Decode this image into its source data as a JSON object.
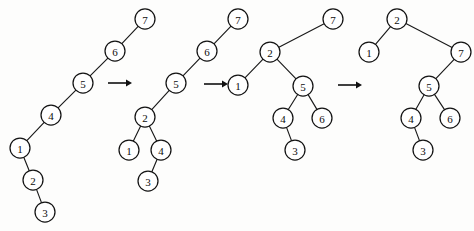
{
  "figure": {
    "background_color": "#fdfdfc",
    "node_fill_color": "#ffffff",
    "node_stroke_color": "#141414",
    "edge_color": "#1a1a1a",
    "arrow_color": "#111111",
    "node_radius": 10
  },
  "trees": [
    {
      "name": "tree-1",
      "root": "7",
      "nodes": [
        {
          "id": "t1-7",
          "label": "7",
          "x": 145,
          "y": 19
        },
        {
          "id": "t1-6",
          "label": "6",
          "x": 115,
          "y": 51
        },
        {
          "id": "t1-5",
          "label": "5",
          "x": 83,
          "y": 83
        },
        {
          "id": "t1-4",
          "label": "4",
          "x": 51,
          "y": 115
        },
        {
          "id": "t1-1",
          "label": "1",
          "x": 20,
          "y": 148
        },
        {
          "id": "t1-2",
          "label": "2",
          "x": 33,
          "y": 180
        },
        {
          "id": "t1-3",
          "label": "3",
          "x": 45,
          "y": 212
        }
      ],
      "edges": [
        {
          "from": "t1-7",
          "to": "t1-6"
        },
        {
          "from": "t1-6",
          "to": "t1-5"
        },
        {
          "from": "t1-5",
          "to": "t1-4"
        },
        {
          "from": "t1-4",
          "to": "t1-1"
        },
        {
          "from": "t1-1",
          "to": "t1-2"
        },
        {
          "from": "t1-2",
          "to": "t1-3"
        }
      ]
    },
    {
      "name": "tree-2",
      "root": "7",
      "nodes": [
        {
          "id": "t2-7",
          "label": "7",
          "x": 238,
          "y": 19
        },
        {
          "id": "t2-6",
          "label": "6",
          "x": 207,
          "y": 51
        },
        {
          "id": "t2-5",
          "label": "5",
          "x": 176,
          "y": 83
        },
        {
          "id": "t2-2",
          "label": "2",
          "x": 145,
          "y": 117
        },
        {
          "id": "t2-1",
          "label": "1",
          "x": 129,
          "y": 150
        },
        {
          "id": "t2-4",
          "label": "4",
          "x": 161,
          "y": 150
        },
        {
          "id": "t2-3",
          "label": "3",
          "x": 148,
          "y": 181
        }
      ],
      "edges": [
        {
          "from": "t2-7",
          "to": "t2-6"
        },
        {
          "from": "t2-6",
          "to": "t2-5"
        },
        {
          "from": "t2-5",
          "to": "t2-2"
        },
        {
          "from": "t2-2",
          "to": "t2-1"
        },
        {
          "from": "t2-2",
          "to": "t2-4"
        },
        {
          "from": "t2-4",
          "to": "t2-3"
        }
      ]
    },
    {
      "name": "tree-3",
      "root": "7",
      "nodes": [
        {
          "id": "t3-7",
          "label": "7",
          "x": 333,
          "y": 19
        },
        {
          "id": "t3-2",
          "label": "2",
          "x": 270,
          "y": 52
        },
        {
          "id": "t3-1",
          "label": "1",
          "x": 238,
          "y": 85
        },
        {
          "id": "t3-5",
          "label": "5",
          "x": 303,
          "y": 86
        },
        {
          "id": "t3-4",
          "label": "4",
          "x": 283,
          "y": 118
        },
        {
          "id": "t3-6",
          "label": "6",
          "x": 322,
          "y": 118
        },
        {
          "id": "t3-3",
          "label": "3",
          "x": 295,
          "y": 150
        }
      ],
      "edges": [
        {
          "from": "t3-7",
          "to": "t3-2"
        },
        {
          "from": "t3-2",
          "to": "t3-1"
        },
        {
          "from": "t3-2",
          "to": "t3-5"
        },
        {
          "from": "t3-5",
          "to": "t3-4"
        },
        {
          "from": "t3-5",
          "to": "t3-6"
        },
        {
          "from": "t3-4",
          "to": "t3-3"
        }
      ]
    },
    {
      "name": "tree-4",
      "root": "2",
      "nodes": [
        {
          "id": "t4-2",
          "label": "2",
          "x": 397,
          "y": 19
        },
        {
          "id": "t4-1",
          "label": "1",
          "x": 369,
          "y": 52
        },
        {
          "id": "t4-7",
          "label": "7",
          "x": 461,
          "y": 52
        },
        {
          "id": "t4-5",
          "label": "5",
          "x": 429,
          "y": 86
        },
        {
          "id": "t4-4",
          "label": "4",
          "x": 411,
          "y": 118
        },
        {
          "id": "t4-6",
          "label": "6",
          "x": 450,
          "y": 118
        },
        {
          "id": "t4-3",
          "label": "3",
          "x": 423,
          "y": 150
        }
      ],
      "edges": [
        {
          "from": "t4-2",
          "to": "t4-1"
        },
        {
          "from": "t4-2",
          "to": "t4-7"
        },
        {
          "from": "t4-7",
          "to": "t4-5"
        },
        {
          "from": "t4-5",
          "to": "t4-4"
        },
        {
          "from": "t4-5",
          "to": "t4-6"
        },
        {
          "from": "t4-4",
          "to": "t4-3"
        }
      ]
    }
  ],
  "arrows": [
    {
      "name": "arrow-1",
      "x": 108,
      "y": 83,
      "length": 24
    },
    {
      "name": "arrow-2",
      "x": 204,
      "y": 84,
      "length": 24
    },
    {
      "name": "arrow-3",
      "x": 338,
      "y": 85,
      "length": 24
    }
  ]
}
